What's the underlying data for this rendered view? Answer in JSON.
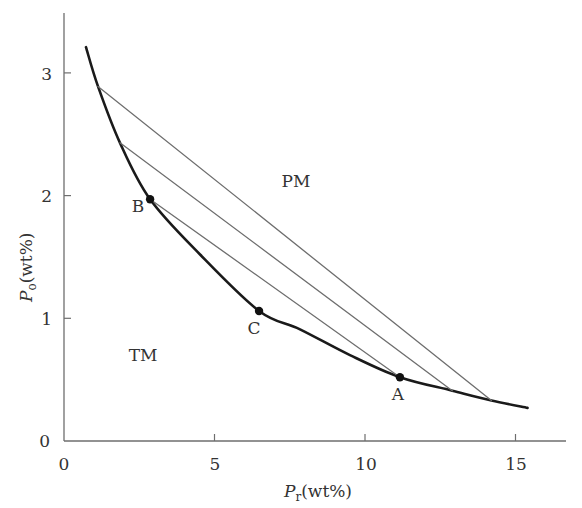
{
  "chart_data": {
    "type": "line",
    "title": "",
    "xlabel": "P_r(wt%)",
    "ylabel": "P_o(wt%)",
    "xlabel_parts": {
      "symbol": "P",
      "subscript": "r",
      "unit": "(wt%)"
    },
    "ylabel_parts": {
      "symbol": "P",
      "subscript": "o",
      "unit": "(wt%)"
    },
    "xlim": [
      0,
      16.7
    ],
    "ylim": [
      0,
      3.49
    ],
    "x_ticks": [
      0,
      5,
      10,
      15
    ],
    "y_ticks": [
      0,
      1,
      2,
      3
    ],
    "x_tick_labels": [
      "0",
      "5",
      "10",
      "15"
    ],
    "y_tick_labels": [
      "0",
      "1",
      "2",
      "3"
    ],
    "grid": false,
    "legend": null,
    "series": [
      {
        "name": "binodal curve",
        "style": "thick",
        "x": [
          0.73,
          1.13,
          1.86,
          2.86,
          4.52,
          6.48,
          7.84,
          9.5,
          11.16,
          12.9,
          14.2,
          15.4
        ],
        "y": [
          3.21,
          2.89,
          2.43,
          1.97,
          1.52,
          1.06,
          0.91,
          0.7,
          0.52,
          0.41,
          0.33,
          0.27
        ]
      },
      {
        "name": "tie line 1",
        "style": "thin",
        "x": [
          1.13,
          14.2
        ],
        "y": [
          2.89,
          0.33
        ]
      },
      {
        "name": "tie line 2",
        "style": "thin",
        "x": [
          1.86,
          12.9
        ],
        "y": [
          2.43,
          0.41
        ]
      },
      {
        "name": "tie line 3 (B–A)",
        "style": "thin",
        "x": [
          2.86,
          11.16
        ],
        "y": [
          1.97,
          0.52
        ]
      }
    ],
    "points": [
      {
        "label": "A",
        "x": 11.16,
        "y": 0.52
      },
      {
        "label": "B",
        "x": 2.86,
        "y": 1.97
      },
      {
        "label": "C",
        "x": 6.48,
        "y": 1.06
      }
    ],
    "annotations": [
      {
        "text": "PM",
        "x": 7.7,
        "y": 2.12,
        "meaning": "upper two-phase region"
      },
      {
        "text": "TM",
        "x": 2.6,
        "y": 0.7,
        "meaning": "lower single-phase region"
      }
    ]
  },
  "labels": {
    "region_pm": "PM",
    "region_tm": "TM",
    "point_a": "A",
    "point_b": "B",
    "point_c": "C",
    "x_tick_0": "0",
    "x_tick_5": "5",
    "x_tick_10": "10",
    "x_tick_15": "15",
    "y_tick_0": "0",
    "y_tick_1": "1",
    "y_tick_2": "2",
    "y_tick_3": "3",
    "x_symbol": "P",
    "x_sub": "r",
    "x_unit": "(wt%)",
    "y_symbol": "P",
    "y_sub": "o",
    "y_unit": "(wt%)"
  },
  "colors": {
    "curve": "#1a1a1a",
    "tie_line": "#6e6e6e",
    "axis": "#6e6e6e",
    "text": "#333333",
    "point": "#111111"
  }
}
